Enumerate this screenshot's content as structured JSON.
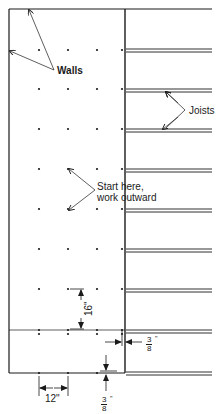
{
  "diagram": {
    "colors": {
      "line": "#1a1a1a",
      "background": "#ffffff"
    },
    "labels": {
      "walls": "Walls",
      "joists": "Joists",
      "start_line1": "Start here,",
      "start_line2": "work outward",
      "spacing_vertical": "16\"",
      "spacing_horizontal": "12\"",
      "gap_side_num": "3",
      "gap_side_den": "8",
      "gap_bottom_num": "3",
      "gap_bottom_den": "8",
      "inch_mark": "\""
    },
    "grid": {
      "columns_x": [
        39,
        68,
        97,
        122
      ],
      "rows_y": [
        50,
        89,
        129,
        169,
        209,
        249,
        289,
        330
      ]
    },
    "joists_y": [
      49,
      89,
      129,
      169,
      209,
      249,
      289,
      330,
      372
    ]
  }
}
